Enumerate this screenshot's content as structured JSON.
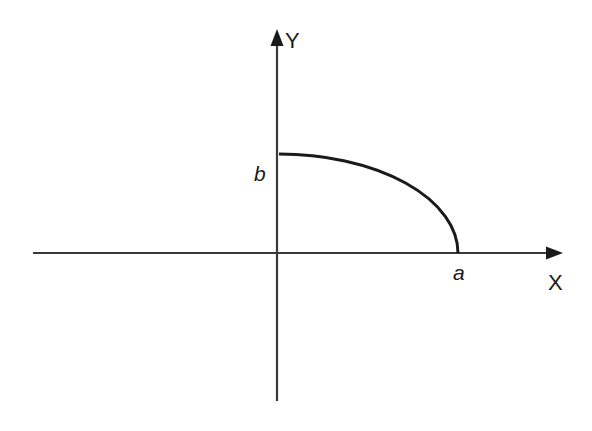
{
  "diagram": {
    "type": "ellipse-quadrant-on-axes",
    "axes": {
      "x": {
        "label": "X"
      },
      "y": {
        "label": "Y"
      }
    },
    "points": {
      "x_intercept": {
        "label": "a"
      },
      "y_intercept": {
        "label": "b"
      }
    },
    "curve": {
      "description": "Quarter ellipse in first quadrant from (0, b) to (a, 0)"
    },
    "colors": {
      "stroke": "#1a1a1a",
      "axis": "#3a3a3a",
      "background": "#ffffff"
    }
  }
}
